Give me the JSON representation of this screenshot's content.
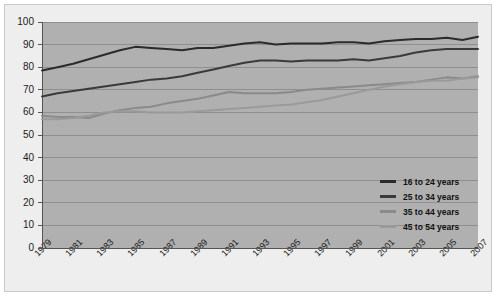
{
  "chart_data": {
    "type": "line",
    "title": "",
    "subtitle": "",
    "xlabel": "",
    "ylabel": "",
    "ylim": [
      0,
      100
    ],
    "ytick_step": 10,
    "yticks": [
      "100",
      "90",
      "80",
      "70",
      "60",
      "50",
      "40",
      "30",
      "20",
      "10",
      "0"
    ],
    "grid": true,
    "grid_axis": "y",
    "legend_position": "inside-bottom-right",
    "x": [
      1979,
      1980,
      1981,
      1982,
      1983,
      1984,
      1985,
      1986,
      1987,
      1988,
      1989,
      1990,
      1991,
      1992,
      1993,
      1994,
      1995,
      1996,
      1997,
      1998,
      1999,
      2000,
      2001,
      2002,
      2003,
      2004,
      2005,
      2006,
      2007
    ],
    "xtick_labels": [
      "1979",
      "1981",
      "1983",
      "1985",
      "1987",
      "1989",
      "1991",
      "1993",
      "1995",
      "1997",
      "1999",
      "2001",
      "2003",
      "2005",
      "2007"
    ],
    "plot_bg": "#b0b0b0",
    "page_bg": "#efeeee",
    "gridline_color": "#8f8f8f",
    "axis_color": "#555555",
    "series": [
      {
        "name": "16 to 24 years",
        "color": "#2b2b2b",
        "values": [
          78.5,
          80.0,
          81.5,
          83.5,
          85.5,
          87.5,
          89.0,
          88.5,
          88.0,
          87.5,
          88.5,
          88.5,
          89.5,
          90.5,
          91.0,
          90.0,
          90.5,
          90.5,
          90.5,
          91.0,
          91.0,
          90.5,
          91.5,
          92.0,
          92.5,
          92.5,
          93.0,
          92.0,
          93.5
        ]
      },
      {
        "name": "25 to 34 years",
        "color": "#3a3a3a",
        "values": [
          67.0,
          68.5,
          69.5,
          70.5,
          71.5,
          72.5,
          73.5,
          74.5,
          75.0,
          76.0,
          77.5,
          79.0,
          80.5,
          82.0,
          83.0,
          83.0,
          82.5,
          83.0,
          83.0,
          83.0,
          83.5,
          83.0,
          84.0,
          85.0,
          86.5,
          87.5,
          88.0,
          88.0,
          88.0
        ]
      },
      {
        "name": "35 to 44 years",
        "color": "#8a8a8a",
        "values": [
          58.5,
          58.0,
          58.0,
          57.5,
          59.5,
          61.0,
          62.0,
          62.5,
          64.0,
          65.0,
          66.0,
          67.5,
          69.0,
          68.5,
          68.5,
          68.5,
          69.0,
          70.0,
          70.5,
          71.0,
          71.5,
          72.0,
          72.5,
          73.0,
          73.5,
          74.5,
          75.5,
          75.0,
          76.0
        ]
      },
      {
        "name": "45 to 54 years",
        "color": "#9a9a9a",
        "values": [
          57.0,
          57.0,
          57.5,
          58.5,
          60.0,
          60.5,
          60.5,
          60.0,
          60.0,
          60.0,
          60.5,
          61.0,
          61.5,
          62.0,
          62.5,
          63.0,
          63.5,
          64.5,
          65.5,
          67.0,
          68.5,
          70.0,
          71.5,
          72.5,
          73.5,
          74.0,
          74.0,
          75.0,
          75.5
        ]
      }
    ]
  }
}
